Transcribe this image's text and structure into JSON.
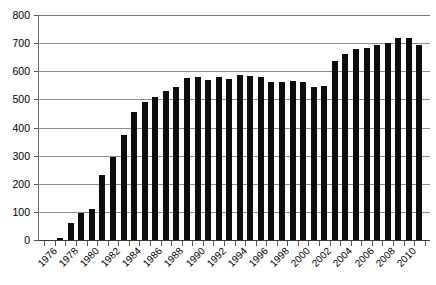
{
  "chart_data": {
    "type": "bar",
    "title": "",
    "subtitle": "",
    "xlabel": "",
    "ylabel": "",
    "ylim": [
      0,
      800
    ],
    "ytick_step": 100,
    "yticks": [
      0,
      100,
      200,
      300,
      400,
      500,
      600,
      700,
      800
    ],
    "ytick_labels": [
      "0",
      "100",
      "200",
      "300",
      "400",
      "500",
      "600",
      "700",
      "800"
    ],
    "grid": true,
    "legend": false,
    "legend_position": "none",
    "bar_color": "#0d0d0d",
    "categories": [
      "1976",
      "1977",
      "1978",
      "1979",
      "1980",
      "1981",
      "1982",
      "1983",
      "1984",
      "1985",
      "1986",
      "1987",
      "1988",
      "1989",
      "1990",
      "1991",
      "1992",
      "1993",
      "1994",
      "1995",
      "1996",
      "1997",
      "1998",
      "1999",
      "2000",
      "2001",
      "2002",
      "2003",
      "2004",
      "2005",
      "2006",
      "2007",
      "2008",
      "2009",
      "2010",
      "2011"
    ],
    "values": [
      0,
      8,
      60,
      95,
      110,
      230,
      295,
      375,
      455,
      490,
      510,
      530,
      545,
      575,
      578,
      570,
      580,
      572,
      585,
      583,
      580,
      563,
      562,
      565,
      562,
      545,
      548,
      635,
      660,
      680,
      682,
      693,
      700,
      718,
      720,
      695
    ],
    "xtick_labels": [
      "1976",
      "1978",
      "1980",
      "1982",
      "1984",
      "1986",
      "1988",
      "1990",
      "1992",
      "1994",
      "1996",
      "1998",
      "2000",
      "2002",
      "2004",
      "2006",
      "2008",
      "2010"
    ],
    "xtick_label_indices": [
      0,
      2,
      4,
      6,
      8,
      10,
      12,
      14,
      16,
      18,
      20,
      22,
      24,
      26,
      28,
      30,
      32,
      34
    ],
    "x_label_rotation": -45
  }
}
